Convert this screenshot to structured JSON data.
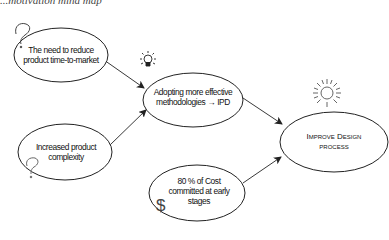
{
  "title": "...motivation mind map",
  "colors": {
    "stroke": "#222222",
    "text": "#111111",
    "background": "#ffffff"
  },
  "nodes": [
    {
      "id": "time-to-market",
      "lines": [
        "The need to reduce",
        "product time-to-market"
      ],
      "icon": "question-mark-icon"
    },
    {
      "id": "complexity",
      "lines": [
        "Increased product",
        "complexity"
      ],
      "icon": "question-mark-icon"
    },
    {
      "id": "ipd",
      "lines": [
        "Adopting more effective",
        "methodologies → IPD"
      ],
      "icon": "lightbulb-icon"
    },
    {
      "id": "cost",
      "lines": [
        "80 % of Cost",
        "committed at early",
        "stages"
      ],
      "icon": "dollar-icon"
    },
    {
      "id": "goal",
      "lines": [
        "Improve Design",
        "process"
      ],
      "icon": "sun-icon"
    }
  ],
  "edges": [
    {
      "from": "time-to-market",
      "to": "ipd"
    },
    {
      "from": "complexity",
      "to": "ipd"
    },
    {
      "from": "ipd",
      "to": "goal"
    },
    {
      "from": "cost",
      "to": "goal"
    }
  ],
  "icons": {
    "question": "?",
    "dollar": "$"
  }
}
